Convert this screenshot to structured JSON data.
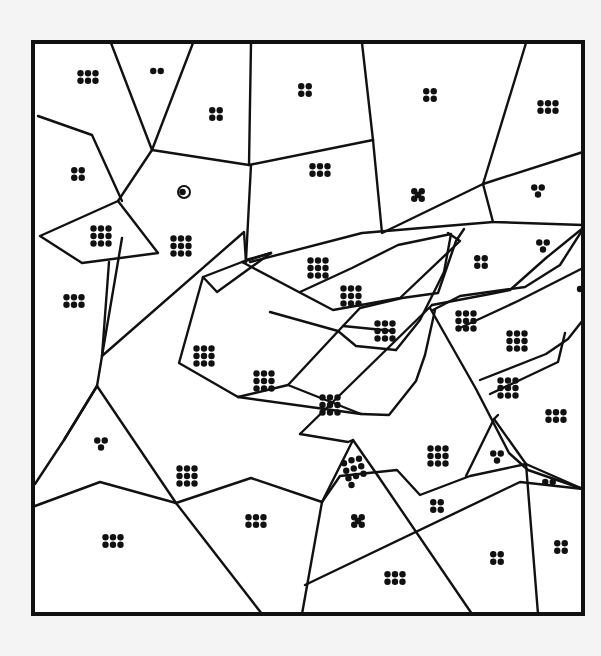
{
  "puzzle": {
    "subject": "swan",
    "frame": {
      "x": 33,
      "y": 42,
      "width": 550,
      "height": 572
    },
    "colors": {
      "background": "#f4f4f4",
      "paper": "#ffffff",
      "ink": "#111111"
    },
    "eye": {
      "x": 184,
      "y": 192,
      "r": 6
    },
    "lines": [
      "M111,43 L152,150 L118,201",
      "M38,116 L92,135 L122,201",
      "M152,150 L193,43",
      "M152,150 L249,165 L373,140",
      "M249,165 L251,43",
      "M251,165 L246,260 L271,253",
      "M373,140 L362,43",
      "M373,140 L382,233 L483,184 L526,43",
      "M483,184 L583,152",
      "M483,184 L493,222 L583,225",
      "M40,236 L118,201 L158,253 L82,263 Z",
      "M250,262 L362,233 L493,222",
      "M109,262 L102,356 L244,232 L246,262",
      "M102,356 L97,386 L64,440",
      "M122,238 L102,356",
      "M271,253 L217,292 L203,277 L179,363 L238,397 L361,414",
      "M203,277 L242,262 L271,253",
      "M238,397 L288,385 L343,326 L360,308 L402,298 L438,293 L456,241 L464,229",
      "M242,262 L333,310 L400,298 L460,241 L448,233",
      "M300,292 L352,268 L398,245 L451,234 L444,272",
      "M343,326 L393,331",
      "M270,312 L338,331 L356,346 L396,350",
      "M396,350 L420,320 L444,272",
      "M288,385 L361,414 L389,415 L416,381 L425,355 L435,310",
      "M432,305 L490,294 L510,290 L546,258 L583,228",
      "M462,327 L518,301 L583,268",
      "M433,310 L460,296 L525,287 L560,265 L583,229",
      "M480,380 L546,354 L568,339 L583,320",
      "M490,394 L520,380 L558,362 L565,333",
      "M430,308 L476,389 L509,453 L528,470 L583,489",
      "M97,386 L64,440 L35,484",
      "M97,386 L176,503",
      "M35,506 L100,482 L176,503 L251,478 L322,502",
      "M176,503 L262,614",
      "M322,502 L302,614",
      "M322,502 L353,440 L378,476",
      "M300,434 L348,442 L353,440",
      "M322,502 L340,476 L397,470 L420,495 L470,476 L526,464 L583,489",
      "M305,585 L520,482 L583,489",
      "M378,476 L472,614",
      "M432,305 L300,434",
      "M526,464 L538,614",
      "M466,476 L494,419 L498,415",
      "M494,419 L526,464"
    ],
    "regions": [
      {
        "id": "r01",
        "label": "6 dots",
        "pattern": "grid-3x2",
        "dots": 6,
        "cx": 88,
        "cy": 77
      },
      {
        "id": "r02",
        "label": "2 dots",
        "pattern": "row-2",
        "dots": 2,
        "cx": 157,
        "cy": 71
      },
      {
        "id": "r03",
        "label": "4 dots",
        "pattern": "grid-2x2",
        "dots": 4,
        "cx": 216,
        "cy": 114
      },
      {
        "id": "r04",
        "label": "4 dots",
        "pattern": "grid-2x2",
        "dots": 4,
        "cx": 305,
        "cy": 90
      },
      {
        "id": "r05",
        "label": "4 dots",
        "pattern": "grid-2x2",
        "dots": 4,
        "cx": 430,
        "cy": 95
      },
      {
        "id": "r06",
        "label": "6 dots",
        "pattern": "grid-3x2",
        "dots": 6,
        "cx": 548,
        "cy": 107
      },
      {
        "id": "r07",
        "label": "4 dots",
        "pattern": "grid-2x2",
        "dots": 4,
        "cx": 78,
        "cy": 174
      },
      {
        "id": "r08",
        "label": "6 dots",
        "pattern": "grid-3x2",
        "dots": 6,
        "cx": 320,
        "cy": 170
      },
      {
        "id": "r09",
        "label": "5 dots",
        "pattern": "x-5",
        "dots": 5,
        "cx": 418,
        "cy": 195
      },
      {
        "id": "r10",
        "label": "3 dots",
        "pattern": "tri-3",
        "dots": 3,
        "cx": 538,
        "cy": 190
      },
      {
        "id": "r11",
        "label": "9 dots",
        "pattern": "grid-3x3",
        "dots": 9,
        "cx": 101,
        "cy": 236
      },
      {
        "id": "r12",
        "label": "9 dots",
        "pattern": "grid-3x3",
        "dots": 9,
        "cx": 181,
        "cy": 246
      },
      {
        "id": "r13",
        "label": "3 dots",
        "pattern": "tri-3",
        "dots": 3,
        "cx": 543,
        "cy": 245
      },
      {
        "id": "r14",
        "label": "4 dots",
        "pattern": "grid-2x2",
        "dots": 4,
        "cx": 481,
        "cy": 262
      },
      {
        "id": "r15",
        "label": "9 dots",
        "pattern": "grid-3x3",
        "dots": 9,
        "cx": 318,
        "cy": 268
      },
      {
        "id": "r16",
        "label": "6 dots",
        "pattern": "grid-3x2",
        "dots": 6,
        "cx": 74,
        "cy": 301
      },
      {
        "id": "r17",
        "label": "9 dots",
        "pattern": "grid-3x3",
        "dots": 9,
        "cx": 351,
        "cy": 296
      },
      {
        "id": "r18",
        "label": "1 dot",
        "pattern": "single",
        "dots": 1,
        "cx": 580,
        "cy": 289
      },
      {
        "id": "r19",
        "label": "9 dots",
        "pattern": "grid-3x3",
        "dots": 9,
        "cx": 466,
        "cy": 321
      },
      {
        "id": "r20",
        "label": "9 dots",
        "pattern": "grid-3x3",
        "dots": 9,
        "cx": 385,
        "cy": 331
      },
      {
        "id": "r21",
        "label": "9 dots",
        "pattern": "grid-3x3",
        "dots": 9,
        "cx": 517,
        "cy": 341
      },
      {
        "id": "r22",
        "label": "9 dots",
        "pattern": "grid-3x3",
        "dots": 9,
        "cx": 204,
        "cy": 356
      },
      {
        "id": "r23",
        "label": "9 dots",
        "pattern": "grid-3x3",
        "dots": 9,
        "cx": 264,
        "cy": 381
      },
      {
        "id": "r24",
        "label": "9 dots",
        "pattern": "grid-3x3",
        "dots": 9,
        "cx": 508,
        "cy": 388
      },
      {
        "id": "r25",
        "label": "9 dots",
        "pattern": "grid-3x3",
        "dots": 9,
        "cx": 330,
        "cy": 405
      },
      {
        "id": "r26",
        "label": "6 dots",
        "pattern": "grid-3x2",
        "dots": 6,
        "cx": 556,
        "cy": 416
      },
      {
        "id": "r27",
        "label": "3 dots",
        "pattern": "tri-3",
        "dots": 3,
        "cx": 101,
        "cy": 443
      },
      {
        "id": "r28",
        "label": "9 dots",
        "pattern": "grid-3x3",
        "dots": 9,
        "cx": 438,
        "cy": 456
      },
      {
        "id": "r29",
        "label": "3 dots",
        "pattern": "tri-3",
        "dots": 3,
        "cx": 497,
        "cy": 456
      },
      {
        "id": "r30",
        "label": "9 dots",
        "pattern": "grid-3x3",
        "dots": 9,
        "cx": 187,
        "cy": 476
      },
      {
        "id": "r31",
        "label": "10 dots",
        "pattern": "tri-10",
        "dots": 10,
        "cx": 353,
        "cy": 473
      },
      {
        "id": "r32",
        "label": "2 dots",
        "pattern": "row-2",
        "dots": 2,
        "cx": 549,
        "cy": 482
      },
      {
        "id": "r33",
        "label": "4 dots",
        "pattern": "grid-2x2",
        "dots": 4,
        "cx": 437,
        "cy": 506
      },
      {
        "id": "r34",
        "label": "6 dots",
        "pattern": "grid-3x2",
        "dots": 6,
        "cx": 256,
        "cy": 521
      },
      {
        "id": "r35",
        "label": "5 dots",
        "pattern": "x-5",
        "dots": 5,
        "cx": 358,
        "cy": 521
      },
      {
        "id": "r36",
        "label": "6 dots",
        "pattern": "grid-3x2",
        "dots": 6,
        "cx": 113,
        "cy": 541
      },
      {
        "id": "r37",
        "label": "4 dots",
        "pattern": "grid-2x2",
        "dots": 4,
        "cx": 561,
        "cy": 547
      },
      {
        "id": "r38",
        "label": "4 dots",
        "pattern": "grid-2x2",
        "dots": 4,
        "cx": 497,
        "cy": 558
      },
      {
        "id": "r39",
        "label": "6 dots",
        "pattern": "grid-3x2",
        "dots": 6,
        "cx": 395,
        "cy": 578
      }
    ]
  }
}
